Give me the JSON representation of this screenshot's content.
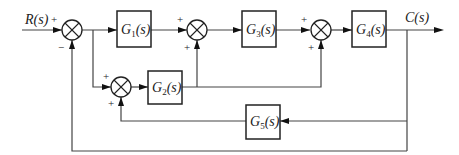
{
  "diagram": {
    "type": "block-diagram",
    "input": {
      "label": "R(s)"
    },
    "output": {
      "label": "C(s)"
    },
    "blocks": [
      {
        "id": "G1",
        "label": "G",
        "sub": "1",
        "suffix": "(s)"
      },
      {
        "id": "G2",
        "label": "G",
        "sub": "2",
        "suffix": "(s)"
      },
      {
        "id": "G3",
        "label": "G",
        "sub": "3",
        "suffix": "(s)"
      },
      {
        "id": "G4",
        "label": "G",
        "sub": "4",
        "suffix": "(s)"
      },
      {
        "id": "G5",
        "label": "G",
        "sub": "5",
        "suffix": "(s)"
      }
    ],
    "junctions": [
      {
        "id": "S1",
        "signs": {
          "left": "+",
          "bottom": "−"
        }
      },
      {
        "id": "S2",
        "signs": {
          "left": "+",
          "bottom": "+"
        }
      },
      {
        "id": "S3",
        "signs": {
          "left": "+",
          "bottom": "+"
        }
      },
      {
        "id": "S4",
        "signs": {
          "left": "+",
          "bottom": "+"
        }
      }
    ],
    "connections": [
      "R(s) -> S1(+)",
      "S1 -> G1",
      "S1 output pickoff -> S4(+)",
      "G1 -> S2(+)",
      "S2 -> G3",
      "G3 -> S3(+)",
      "S3 -> G4",
      "G4 -> C(s)",
      "S4 -> G2",
      "G2 -> S2(+)",
      "G2 -> S3(+)",
      "C(s) -> G5",
      "G5 -> S4(+)",
      "C(s) -> S1(−)"
    ]
  }
}
